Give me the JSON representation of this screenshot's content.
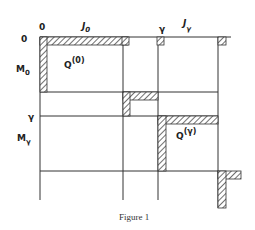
{
  "figure": {
    "caption": "Figure 1",
    "column_labels": {
      "origin": "0",
      "block0": "J",
      "block0_sub": "0",
      "gamma": "γ",
      "blockg": "J",
      "blockg_sub": "γ"
    },
    "row_labels": {
      "origin": "0",
      "block0": "M",
      "block0_sub": "0",
      "gamma": "γ",
      "blockg": "M",
      "blockg_sub": "γ"
    },
    "blocks": [
      {
        "label": "Q",
        "superscript": "(0)"
      },
      {
        "label": "Q",
        "superscript": "(γ)"
      }
    ]
  },
  "colors": {
    "line": "#333333",
    "hatch": "#333333",
    "background": "#ffffff"
  }
}
